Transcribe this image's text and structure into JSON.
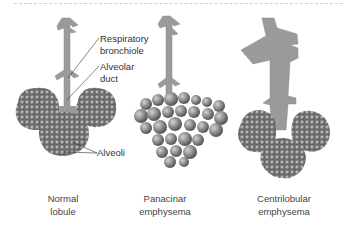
{
  "diagram": {
    "panels": [
      {
        "id": "normal",
        "caption_line1": "Normal",
        "caption_line2": "lobule"
      },
      {
        "id": "panacinar",
        "caption_line1": "Panacinar",
        "caption_line2": "emphysema"
      },
      {
        "id": "centrilobular",
        "caption_line1": "Centrilobular",
        "caption_line2": "emphysema"
      }
    ],
    "annotations": {
      "respiratory_bronchiole_line1": "Respiratory",
      "respiratory_bronchiole_line2": "bronchiole",
      "alveolar_duct_line1": "Alveolar",
      "alveolar_duct_line2": "duct",
      "alveoli": "Alveoli"
    },
    "colors": {
      "airway": "#9a9a9a",
      "alveolus": "#8c8c8c",
      "alveolus_highlight": "#c8c8c8",
      "leader_line": "#333333"
    }
  }
}
